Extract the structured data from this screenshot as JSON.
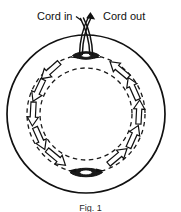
{
  "figure": {
    "caption": "Fig. 1",
    "labels": {
      "cord_in": "Cord in",
      "cord_out": "Cord out"
    },
    "colors": {
      "stroke": "#111111",
      "background": "#ffffff",
      "fill_dark": "#1a1a1a"
    },
    "geometry": {
      "center_x": 86,
      "center_y": 114,
      "outer_radius": 79,
      "channel_outer_radius": 59,
      "channel_inner_radius": 46
    },
    "annotations": {
      "flow_direction": "counterclockwise",
      "arrow_count": 10,
      "top_eyelet": "cord-entry-grommet",
      "bottom_eyelet": "cord-turn-grommet"
    }
  }
}
